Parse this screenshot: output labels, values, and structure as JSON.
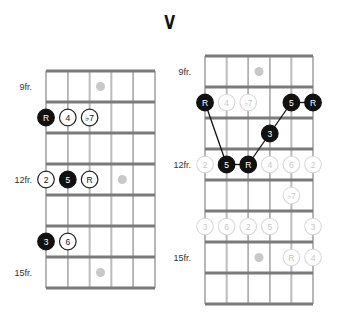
{
  "title": "V",
  "colors": {
    "fret": "#7a7a7a",
    "string": "#888888",
    "inlay": "#c8c8c8",
    "root_fill": "#111111",
    "open_stroke": "#222222",
    "ghost_stroke": "#d8d8d8",
    "ghost_text": "#c8c8c8",
    "line": "#111111"
  },
  "diagrams": [
    {
      "id": "left",
      "origin_x": 46,
      "origin_y": 71,
      "string_spacing": 21.8,
      "fret_spacing": 31,
      "num_frets": 7,
      "fret_labels": [
        {
          "text": "9fr.",
          "row": 0
        },
        {
          "text": "12fr.",
          "row": 3
        },
        {
          "text": "15fr.",
          "row": 6
        }
      ],
      "inlays": [
        {
          "string": 2.5,
          "row": 0
        },
        {
          "string": 3.5,
          "row": 3
        },
        {
          "string": 2.5,
          "row": 6
        }
      ],
      "notes": [
        {
          "label": "R",
          "string": 0,
          "row": 1,
          "style": "filled"
        },
        {
          "label": "4",
          "string": 1,
          "row": 1,
          "style": "open"
        },
        {
          "label": "♭7",
          "string": 2,
          "row": 1,
          "style": "open"
        },
        {
          "label": "2",
          "string": 0,
          "row": 3,
          "style": "open"
        },
        {
          "label": "5",
          "string": 1,
          "row": 3,
          "style": "filled"
        },
        {
          "label": "R",
          "string": 2,
          "row": 3,
          "style": "open"
        },
        {
          "label": "3",
          "string": 0,
          "row": 5,
          "style": "filled"
        },
        {
          "label": "6",
          "string": 1,
          "row": 5,
          "style": "open"
        }
      ],
      "lines": []
    },
    {
      "id": "right",
      "origin_x": 205,
      "origin_y": 56,
      "string_spacing": 21.6,
      "fret_spacing": 31,
      "num_frets": 8,
      "fret_labels": [
        {
          "text": "9fr.",
          "row": 0
        },
        {
          "text": "12fr.",
          "row": 3
        },
        {
          "text": "15fr.",
          "row": 6
        }
      ],
      "inlays": [
        {
          "string": 2.5,
          "row": 0
        },
        {
          "string": 2.5,
          "row": 6
        }
      ],
      "notes": [
        {
          "label": "R",
          "string": 0,
          "row": 1,
          "style": "filled"
        },
        {
          "label": "4",
          "string": 1,
          "row": 1,
          "style": "ghost"
        },
        {
          "label": "♭7",
          "string": 2,
          "row": 1,
          "style": "ghost"
        },
        {
          "label": "5",
          "string": 4,
          "row": 1,
          "style": "filled"
        },
        {
          "label": "R",
          "string": 5,
          "row": 1,
          "style": "filled"
        },
        {
          "label": "3",
          "string": 3,
          "row": 2,
          "style": "filled"
        },
        {
          "label": "2",
          "string": 0,
          "row": 3,
          "style": "ghost"
        },
        {
          "label": "5",
          "string": 1,
          "row": 3,
          "style": "filled"
        },
        {
          "label": "R",
          "string": 2,
          "row": 3,
          "style": "filled"
        },
        {
          "label": "4",
          "string": 3,
          "row": 3,
          "style": "ghost"
        },
        {
          "label": "6",
          "string": 4,
          "row": 3,
          "style": "ghost"
        },
        {
          "label": "2",
          "string": 5,
          "row": 3,
          "style": "ghost"
        },
        {
          "label": "♭7",
          "string": 4,
          "row": 4,
          "style": "ghost"
        },
        {
          "label": "3",
          "string": 0,
          "row": 5,
          "style": "ghost"
        },
        {
          "label": "6",
          "string": 1,
          "row": 5,
          "style": "ghost"
        },
        {
          "label": "2",
          "string": 2,
          "row": 5,
          "style": "ghost"
        },
        {
          "label": "5",
          "string": 3,
          "row": 5,
          "style": "ghost"
        },
        {
          "label": "3",
          "string": 5,
          "row": 5,
          "style": "ghost"
        },
        {
          "label": "R",
          "string": 4,
          "row": 6,
          "style": "ghost"
        },
        {
          "label": "4",
          "string": 5,
          "row": 6,
          "style": "ghost"
        }
      ],
      "lines": [
        {
          "from": [
            0,
            1
          ],
          "to": [
            1,
            3
          ]
        },
        {
          "from": [
            1,
            3
          ],
          "to": [
            2,
            3
          ]
        },
        {
          "from": [
            2,
            3
          ],
          "to": [
            3,
            2
          ]
        },
        {
          "from": [
            3,
            2
          ],
          "to": [
            4,
            1
          ]
        },
        {
          "from": [
            4,
            1
          ],
          "to": [
            5,
            1
          ]
        }
      ]
    }
  ]
}
